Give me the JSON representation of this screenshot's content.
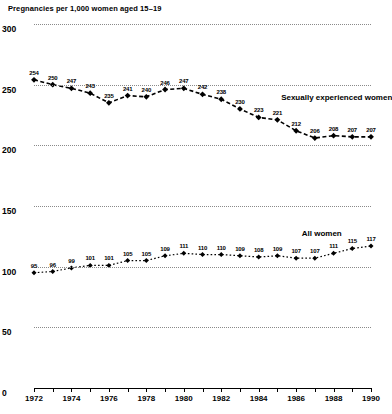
{
  "chart_data": {
    "type": "line",
    "title": "Pregnancies per 1,000 women aged 15–19",
    "xlabel": "",
    "ylabel": "Pregnancies per 1,000 women aged 15–19",
    "ylim": [
      0,
      300
    ],
    "yticks": [
      0,
      50,
      100,
      150,
      200,
      250,
      300
    ],
    "ytick_labels": [
      "0",
      "50",
      "100",
      "150",
      "200",
      "250",
      "300"
    ],
    "grid": true,
    "legend_position": "inline-labels",
    "x": [
      1972,
      1973,
      1974,
      1975,
      1976,
      1977,
      1978,
      1979,
      1980,
      1981,
      1982,
      1983,
      1984,
      1985,
      1986,
      1987,
      1988,
      1989,
      1990
    ],
    "xtick_labels": [
      "1972",
      "1974",
      "1976",
      "1978",
      "1980",
      "1982",
      "1984",
      "1986",
      "1988",
      "1990"
    ],
    "xtick_values": [
      1972,
      1974,
      1976,
      1978,
      1980,
      1982,
      1984,
      1986,
      1988,
      1990
    ],
    "xlim": [
      1972,
      1990
    ],
    "series": [
      {
        "name": "Sexually experienced women",
        "values": [
          254,
          250,
          247,
          243,
          235,
          241,
          240,
          246,
          247,
          242,
          238,
          230,
          223,
          221,
          212,
          206,
          208,
          207,
          207
        ],
        "label_x": 1985.2,
        "label_y": 243
      },
      {
        "name": "All women",
        "values": [
          95,
          96,
          99,
          101,
          101,
          105,
          105,
          109,
          111,
          110,
          110,
          109,
          108,
          109,
          107,
          107,
          111,
          115,
          117
        ],
        "label_x": 1986.3,
        "label_y": 131
      }
    ]
  }
}
